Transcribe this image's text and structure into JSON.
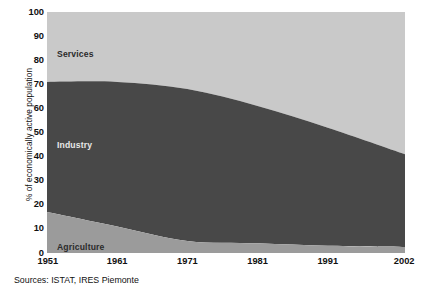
{
  "chart_data": {
    "type": "area",
    "title": "",
    "subtitle": "",
    "xlabel": "",
    "ylabel": "% of economically active population",
    "stacked": true,
    "stack_order": [
      "Agriculture",
      "Industry",
      "Services"
    ],
    "grid": false,
    "legend_position": "inline-band-labels",
    "x": [
      1951,
      1961,
      1971,
      1981,
      1991,
      2002
    ],
    "xticklabels": [
      "1951",
      "1961",
      "1971",
      "1981",
      "1991",
      "2002"
    ],
    "xlim": [
      1951,
      2002
    ],
    "ylim": [
      0,
      100
    ],
    "yticks": [
      0,
      10,
      20,
      30,
      40,
      50,
      60,
      70,
      80,
      90,
      100
    ],
    "yticklabels": [
      "0",
      "10",
      "20",
      "30",
      "40",
      "50",
      "60",
      "70",
      "80",
      "90",
      "100"
    ],
    "series": [
      {
        "name": "Agriculture",
        "color": "#9b9b9b",
        "values": [
          17,
          11,
          5,
          4,
          3,
          2.5
        ]
      },
      {
        "name": "Industry",
        "color": "#484848",
        "values": [
          54,
          60,
          63,
          57,
          49,
          38.5
        ]
      },
      {
        "name": "Services",
        "color": "#c9c9c9",
        "values": [
          29,
          29,
          32,
          39,
          48,
          59
        ]
      }
    ],
    "cumulative_boundaries": {
      "agriculture_top": [
        17,
        11,
        5,
        4,
        3,
        2.5
      ],
      "industry_top": [
        71,
        71,
        68,
        61,
        52,
        41
      ],
      "services_top": [
        100,
        100,
        100,
        100,
        100,
        100
      ]
    },
    "annotations": [
      {
        "name": "Services",
        "text": "Services"
      },
      {
        "name": "Industry",
        "text": "Industry"
      },
      {
        "name": "Agriculture",
        "text": "Agriculture"
      }
    ],
    "source_note": "Sources: ISTAT, IRES Piemonte"
  },
  "colors": {
    "services": "#c9c9c9",
    "industry": "#484848",
    "agriculture": "#9b9b9b",
    "background": "#ffffff",
    "text": "#111111"
  }
}
